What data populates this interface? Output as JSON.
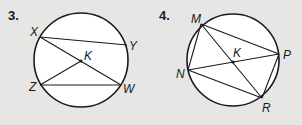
{
  "problems": [
    {
      "number": "3.",
      "center_label": "K",
      "points": {
        "X": {
          "label": "X"
        },
        "Y": {
          "label": "Y"
        },
        "Z": {
          "label": "Z"
        },
        "W": {
          "label": "W"
        },
        "K": {
          "label": "K"
        }
      },
      "segments": [
        "XY",
        "XW",
        "ZW",
        "ZK"
      ]
    },
    {
      "number": "4.",
      "center_label": "K",
      "points": {
        "M": {
          "label": "M"
        },
        "N": {
          "label": "N"
        },
        "P": {
          "label": "P"
        },
        "R": {
          "label": "R"
        },
        "K": {
          "label": "K"
        }
      },
      "segments": [
        "MN",
        "MP",
        "MR",
        "NP",
        "NR",
        "PR"
      ]
    }
  ],
  "colors": {
    "background": "#e6e6e4",
    "circle_fill": "#ffffff",
    "stroke": "#1a1a1a"
  }
}
